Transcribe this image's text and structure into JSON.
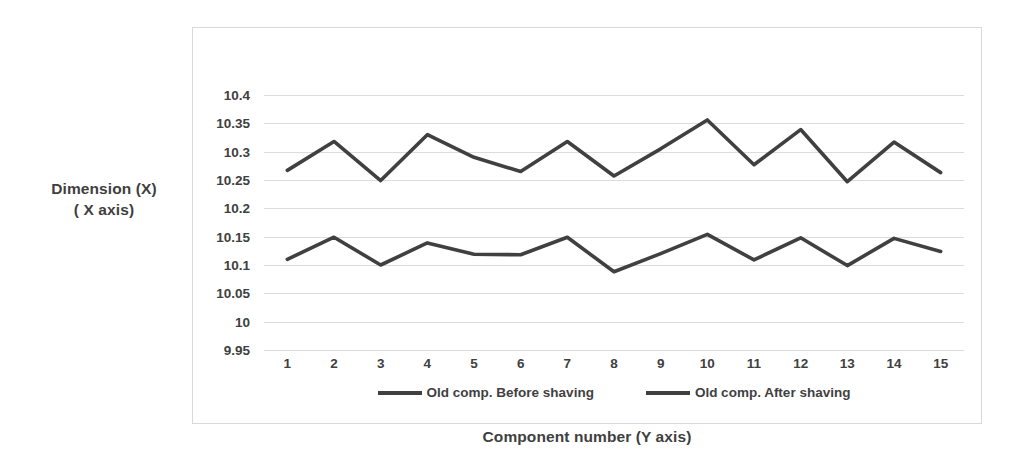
{
  "chart_data": {
    "type": "line",
    "title": "",
    "xlabel": "Component number (Y axis)",
    "ylabel_lines": [
      "Dimension (X)",
      "( X axis)"
    ],
    "ylabel": "Dimension (X) ( X axis)",
    "categories": [
      "1",
      "2",
      "3",
      "4",
      "5",
      "6",
      "7",
      "8",
      "9",
      "10",
      "11",
      "12",
      "13",
      "14",
      "15"
    ],
    "x_tick_labels": [
      "1",
      "2",
      "3",
      "4",
      "5",
      "6",
      "7",
      "8",
      "9",
      "10",
      "11",
      "12",
      "13",
      "14",
      "15"
    ],
    "y_tick_labels": [
      "10.4",
      "10.35",
      "10.3",
      "10.25",
      "10.2",
      "10.15",
      "10.1",
      "10.05",
      "10",
      "9.95"
    ],
    "y_tick_values": [
      10.4,
      10.35,
      10.3,
      10.25,
      10.2,
      10.15,
      10.1,
      10.05,
      10.0,
      9.95
    ],
    "ylim": [
      9.95,
      10.4
    ],
    "grid": true,
    "legend_position": "bottom",
    "series": [
      {
        "name": "Old comp. Before shaving",
        "color": "#404040",
        "values": [
          10.267,
          10.318,
          10.249,
          10.33,
          10.29,
          10.265,
          10.318,
          10.257,
          10.305,
          10.356,
          10.277,
          10.339,
          10.247,
          10.317,
          10.263
        ]
      },
      {
        "name": "Old comp. After shaving",
        "color": "#404040",
        "values": [
          10.11,
          10.149,
          10.1,
          10.139,
          10.119,
          10.118,
          10.149,
          10.088,
          10.12,
          10.154,
          10.109,
          10.148,
          10.099,
          10.147,
          10.124
        ]
      }
    ]
  },
  "axes": {
    "y_title_line1": "Dimension (X)",
    "y_title_line2": "( X axis)",
    "x_title": "Component number (Y axis)"
  },
  "legend": {
    "items": [
      {
        "label": "Old comp. Before shaving"
      },
      {
        "label": "Old comp. After shaving"
      }
    ]
  },
  "style": {
    "line_color": "#404040",
    "grid_color": "#dcdcdc",
    "frame_color": "#d9d9d9",
    "text_color": "#3f3f3f",
    "background": "#ffffff"
  }
}
